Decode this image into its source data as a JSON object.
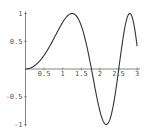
{
  "chart_data": {
    "type": "line",
    "title": "",
    "xlabel": "",
    "ylabel": "",
    "function": "sin(x^2)",
    "xlim": [
      0,
      3
    ],
    "ylim": [
      -1,
      1
    ],
    "grid": false,
    "legend": null,
    "x_ticks": [
      0.5,
      1,
      1.5,
      2,
      2.5,
      3
    ],
    "x_tick_labels": [
      "0.5",
      "1",
      "1.5",
      "2",
      "2.5",
      "3"
    ],
    "y_ticks": [
      -1,
      -0.5,
      0.5,
      1
    ],
    "y_tick_labels": [
      "-1",
      "-0.5",
      "0.5",
      "1"
    ],
    "series": [
      {
        "name": "sin(x^2)",
        "color": "#333333",
        "x": [
          0,
          0.25,
          0.5,
          0.75,
          1.0,
          1.25,
          1.5,
          1.75,
          2.0,
          2.25,
          2.5,
          2.75,
          3.0
        ],
        "values": [
          0,
          0.062,
          0.247,
          0.533,
          0.841,
          1.0,
          0.778,
          0.081,
          -0.757,
          -0.951,
          -0.033,
          0.951,
          0.412
        ]
      }
    ]
  },
  "layout": {
    "origin_px": [
      25.5,
      69
    ],
    "x_scale_px": 37.2,
    "y_scale_px": 55.5
  }
}
